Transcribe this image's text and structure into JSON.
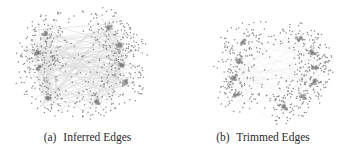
{
  "figure": {
    "panels": [
      {
        "id": "a",
        "label": "(a)",
        "caption": "Inferred Edges",
        "graph": {
          "node_color": "#8a8a8a",
          "edge_color": "#d8d8d8",
          "hub_color": "#7a7a7a",
          "bounds": {
            "x": 15,
            "y": 8,
            "w": 133,
            "h": 110
          },
          "hubs": [
            [
              45,
              33
            ],
            [
              38,
              53
            ],
            [
              39,
              68
            ],
            [
              48,
              98
            ],
            [
              97,
              102
            ],
            [
              110,
              28
            ],
            [
              120,
              45
            ],
            [
              122,
              65
            ],
            [
              125,
              82
            ]
          ],
          "cluster_radius": 22,
          "seed": 7,
          "node_count": 620,
          "dense_edges": true
        }
      },
      {
        "id": "b",
        "label": "(b)",
        "caption": "Trimmed Edges",
        "graph": {
          "node_color": "#8a8a8a",
          "edge_color": "#e2e2e2",
          "hub_color": "#7a7a7a",
          "bounds": {
            "x": 37,
            "y": 18,
            "w": 120,
            "h": 104
          },
          "hubs": [
            [
              68,
              42
            ],
            [
              64,
              61
            ],
            [
              59,
              78
            ],
            [
              62,
              94
            ],
            [
              124,
              39
            ],
            [
              138,
              52
            ],
            [
              140,
              68
            ],
            [
              138,
              82
            ],
            [
              128,
              97
            ],
            [
              109,
              107
            ]
          ],
          "cluster_radius": 20,
          "seed": 13,
          "node_count": 560,
          "dense_edges": false
        }
      }
    ]
  }
}
